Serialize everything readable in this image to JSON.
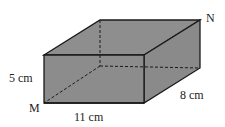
{
  "figure": {
    "shape": "rectangular-prism",
    "fill_color": "#8c8c8c",
    "edge_color": "#1a1a1a",
    "vertices": {
      "M": "M",
      "N": "N"
    },
    "dimensions": {
      "height": "5 cm",
      "length": "11 cm",
      "depth": "8 cm"
    }
  }
}
